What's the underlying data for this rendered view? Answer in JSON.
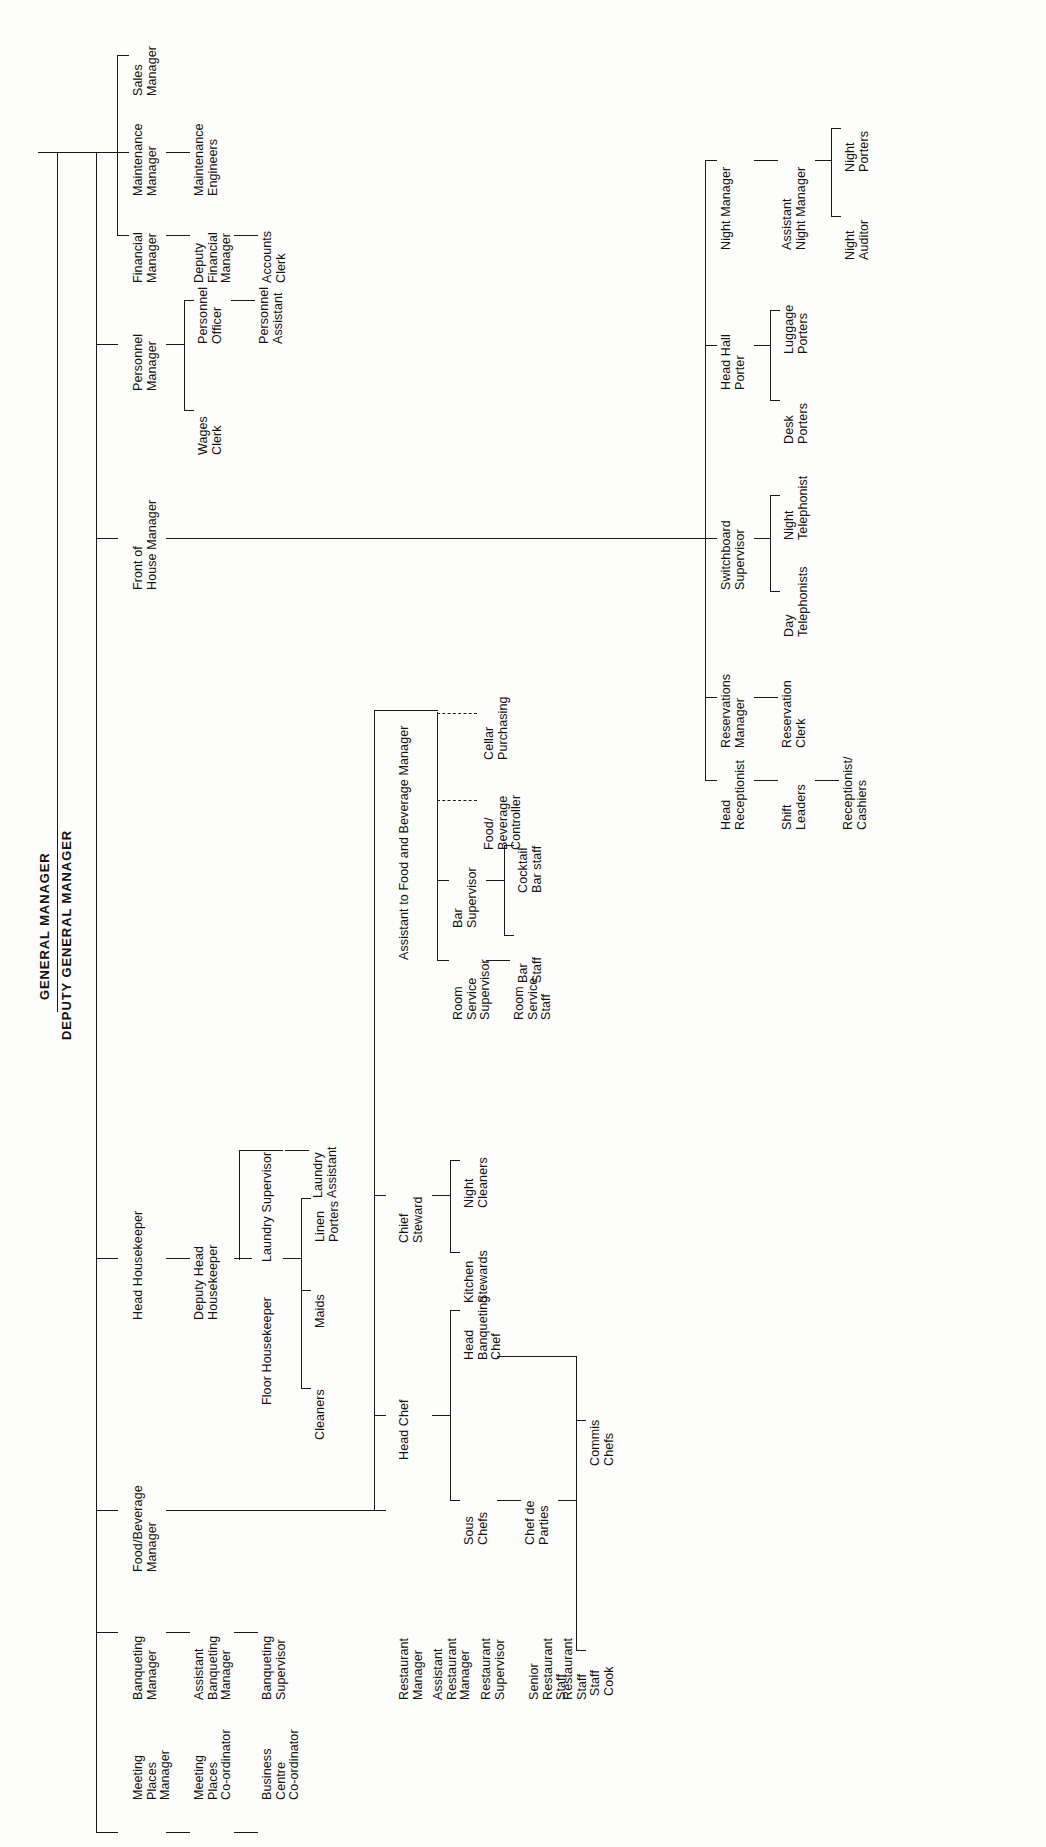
{
  "document": {
    "kind": "organisation-chart",
    "orientation": "rotated-90-ccw",
    "subject": "Hotel organisation structure"
  },
  "root": {
    "general_manager": "GENERAL MANAGER",
    "deputy_general_manager": "DEPUTY GENERAL MANAGER"
  },
  "nodes": {
    "sales_manager": "Sales\nManager",
    "maintenance_manager": "Maintenance\nManager",
    "maintenance_engineers": "Maintenance\nEngineers",
    "financial_manager": "Financial\nManager",
    "deputy_financial_manager": "Deputy\nFinancial\nManager",
    "accounts_clerk": "Accounts\nClerk",
    "personnel_manager": "Personnel\nManager",
    "personnel_officer": "Personnel\nOfficer",
    "personnel_assistant": "Personnel\nAssistant",
    "wages_clerk": "Wages\nClerk",
    "front_of_house_manager": "Front of\nHouse Manager",
    "night_manager": "Night Manager",
    "assistant_night_manager": "Assistant\nNight Manager",
    "night_porters": "Night\nPorters",
    "night_auditor": "Night\nAuditor",
    "head_hall_porter": "Head Hall\nPorter",
    "luggage_porters": "Luggage\nPorters",
    "desk_porters": "Desk\nPorters",
    "switchboard_supervisor": "Switchboard\nSupervisor",
    "night_telephonist": "Night\nTelephonist",
    "day_telephonists": "Day\nTelephonists",
    "reservations_manager": "Reservations\nManager",
    "reservation_clerk": "Reservation\nClerk",
    "head_receptionist": "Head\nReceptionist",
    "shift_leaders": "Shift\nLeaders",
    "receptionist_cashiers": "Receptionist/\nCashiers",
    "head_housekeeper": "Head Housekeeper",
    "deputy_head_housekeeper": "Deputy Head\nHousekeeper",
    "floor_housekeeper": "Floor Housekeeper",
    "laundry_supervisor": "Laundry Supervisor",
    "laundry_assistant": "Laundry\nAssistant",
    "linen_porters": "Linen\nPorters",
    "maids": "Maids",
    "cleaners": "Cleaners",
    "food_beverage_manager": "Food/Beverage\nManager",
    "assistant_to_fb_manager": "Assistant to Food and Beverage Manager",
    "cellar_purchasing": "Cellar\nPurchasing",
    "food_beverage_controller": "Food/\nBeverage\nController",
    "bar_supervisor": "Bar\nSupervisor",
    "cocktail_bar_staff": "Cocktail\nBar staff",
    "bar_staff": "Bar\nStaff",
    "room_service_supervisor": "Room\nService\nSupervisor",
    "room_service_staff": "Room\nService\nStaff",
    "chief_steward": "Chief\nSteward",
    "night_cleaners": "Night\nCleaners",
    "kitchen_stewards": "Kitchen\nStewards",
    "head_chef": "Head Chef",
    "head_banqueting_chef": "Head\nBanqueting\nChef",
    "sous_chefs": "Sous\nChefs",
    "chef_de_parties": "Chef de\nParties",
    "commis_chefs": "Commis\nChefs",
    "staff_cook": "Staff\nCook",
    "restaurant_manager": "Restaurant\nManager",
    "assistant_restaurant_manager": "Assistant\nRestaurant\nManager",
    "restaurant_supervisor": "Restaurant\nSupervisor",
    "senior_restaurant_staff": "Senior\nRestaurant\nStaff",
    "restaurant_staff": "Restaurant\nStaff",
    "banqueting_manager": "Banqueting\nManager",
    "assistant_banqueting_manager": "Assistant\nBanqueting\nManager",
    "banqueting_supervisor": "Banqueting\nSupervisor",
    "meeting_places_manager": "Meeting\nPlaces\nManager",
    "meeting_places_coordinator": "Meeting\nPlaces\nCo-ordinator",
    "business_centre_coordinator": "Business\nCentre\nCo-ordinator"
  },
  "colors": {
    "line": "#1a1a1a",
    "text": "#111111",
    "background": "#fdfdfb"
  }
}
